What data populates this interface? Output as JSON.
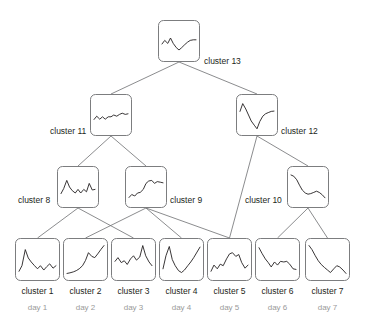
{
  "diagram": {
    "stroke_color": "#6d6e71",
    "line_color": "#231f20",
    "box_fill": "#ffffff",
    "label_color": "#231f20",
    "day_label_color": "#9a9a9a",
    "background": "#ffffff"
  },
  "chart_data": {
    "type": "line",
    "xlabel": "",
    "ylabel": "",
    "grid": false,
    "legend": "none",
    "ylim": [
      0,
      1
    ],
    "nodes": [
      {
        "id": "cluster1",
        "label": "cluster 1",
        "day": "day 1",
        "level": "leaf",
        "box": {
          "x": 15,
          "y": 238,
          "w": 45,
          "h": 43
        },
        "label_pos": {
          "x": 37.5,
          "y": 287
        },
        "day_pos": {
          "x": 37.5,
          "y": 304
        },
        "x": [
          0,
          0.08,
          0.17,
          0.25,
          0.33,
          0.42,
          0.5,
          0.58,
          0.67,
          0.75,
          0.83,
          0.92,
          1
        ],
        "values": [
          0.12,
          0.3,
          0.82,
          0.55,
          0.42,
          0.3,
          0.2,
          0.3,
          0.16,
          0.27,
          0.36,
          0.22,
          0.3
        ]
      },
      {
        "id": "cluster2",
        "label": "cluster 2",
        "day": "day 2",
        "level": "leaf",
        "box": {
          "x": 63,
          "y": 238,
          "w": 45,
          "h": 43
        },
        "label_pos": {
          "x": 85.5,
          "y": 287
        },
        "day_pos": {
          "x": 85.5,
          "y": 304
        },
        "x": [
          0,
          0.08,
          0.17,
          0.25,
          0.33,
          0.42,
          0.5,
          0.58,
          0.67,
          0.75,
          0.83,
          0.92,
          1
        ],
        "values": [
          0.05,
          0.07,
          0.1,
          0.14,
          0.2,
          0.3,
          0.47,
          0.72,
          0.6,
          0.56,
          0.68,
          0.83,
          0.95
        ]
      },
      {
        "id": "cluster3",
        "label": "cluster 3",
        "day": "day 3",
        "level": "leaf",
        "box": {
          "x": 111,
          "y": 238,
          "w": 45,
          "h": 43
        },
        "label_pos": {
          "x": 133.5,
          "y": 287
        },
        "day_pos": {
          "x": 133.5,
          "y": 304
        },
        "x": [
          0,
          0.08,
          0.17,
          0.25,
          0.33,
          0.42,
          0.5,
          0.58,
          0.67,
          0.75,
          0.83,
          0.92,
          1
        ],
        "values": [
          0.44,
          0.56,
          0.4,
          0.46,
          0.34,
          0.52,
          0.62,
          0.48,
          0.58,
          0.95,
          0.62,
          0.42,
          0.3
        ]
      },
      {
        "id": "cluster4",
        "label": "cluster 4",
        "day": "day 4",
        "level": "leaf",
        "box": {
          "x": 159,
          "y": 238,
          "w": 45,
          "h": 43
        },
        "label_pos": {
          "x": 181.5,
          "y": 287
        },
        "day_pos": {
          "x": 181.5,
          "y": 304
        },
        "x": [
          0,
          0.08,
          0.17,
          0.25,
          0.33,
          0.42,
          0.5,
          0.58,
          0.67,
          0.75,
          0.83,
          0.92,
          1
        ],
        "values": [
          0.2,
          0.62,
          0.92,
          0.5,
          0.3,
          0.14,
          0.08,
          0.16,
          0.3,
          0.42,
          0.56,
          0.74,
          0.9
        ]
      },
      {
        "id": "cluster5",
        "label": "cluster 5",
        "day": "day 5",
        "level": "leaf",
        "box": {
          "x": 207,
          "y": 238,
          "w": 45,
          "h": 43
        },
        "label_pos": {
          "x": 229.5,
          "y": 287
        },
        "day_pos": {
          "x": 229.5,
          "y": 304
        },
        "x": [
          0,
          0.08,
          0.17,
          0.25,
          0.33,
          0.42,
          0.5,
          0.58,
          0.67,
          0.75,
          0.83,
          0.92,
          1
        ],
        "values": [
          0.12,
          0.32,
          0.2,
          0.35,
          0.3,
          0.52,
          0.68,
          0.72,
          0.6,
          0.66,
          0.4,
          0.22,
          0.32
        ]
      },
      {
        "id": "cluster6",
        "label": "cluster 6",
        "day": "day 6",
        "level": "leaf",
        "box": {
          "x": 255,
          "y": 238,
          "w": 45,
          "h": 43
        },
        "label_pos": {
          "x": 277.5,
          "y": 287
        },
        "day_pos": {
          "x": 277.5,
          "y": 304
        },
        "x": [
          0,
          0.08,
          0.17,
          0.25,
          0.33,
          0.42,
          0.5,
          0.58,
          0.67,
          0.75,
          0.83,
          0.92,
          1
        ],
        "values": [
          0.88,
          0.7,
          0.52,
          0.4,
          0.26,
          0.42,
          0.32,
          0.44,
          0.42,
          0.44,
          0.35,
          0.2,
          0.18
        ]
      },
      {
        "id": "cluster7",
        "label": "cluster 7",
        "day": "day 7",
        "level": "leaf",
        "box": {
          "x": 305,
          "y": 238,
          "w": 45,
          "h": 43
        },
        "label_pos": {
          "x": 327.5,
          "y": 287
        },
        "day_pos": {
          "x": 327.5,
          "y": 304
        },
        "x": [
          0,
          0.08,
          0.17,
          0.25,
          0.33,
          0.42,
          0.5,
          0.58,
          0.67,
          0.75,
          0.83,
          0.92,
          1
        ],
        "values": [
          0.95,
          0.82,
          0.62,
          0.46,
          0.34,
          0.24,
          0.16,
          0.08,
          0.2,
          0.3,
          0.26,
          0.16,
          0.05
        ]
      },
      {
        "id": "cluster8",
        "label": "cluster 8",
        "level": "internal",
        "box": {
          "x": 57,
          "y": 166,
          "w": 42,
          "h": 42
        },
        "label_pos": {
          "x": 18,
          "y": 196
        },
        "x": [
          0,
          0.08,
          0.17,
          0.25,
          0.33,
          0.42,
          0.5,
          0.58,
          0.67,
          0.75,
          0.83,
          0.92,
          1
        ],
        "values": [
          0.28,
          0.45,
          0.72,
          0.5,
          0.38,
          0.3,
          0.42,
          0.3,
          0.42,
          0.34,
          0.62,
          0.4,
          0.42
        ]
      },
      {
        "id": "cluster9",
        "label": "cluster 9",
        "level": "internal",
        "box": {
          "x": 125,
          "y": 166,
          "w": 42,
          "h": 42
        },
        "label_pos": {
          "x": 170,
          "y": 196
        },
        "x": [
          0,
          0.08,
          0.17,
          0.25,
          0.33,
          0.42,
          0.5,
          0.58,
          0.67,
          0.75,
          0.83,
          0.92,
          1
        ],
        "values": [
          0.15,
          0.25,
          0.2,
          0.3,
          0.32,
          0.42,
          0.62,
          0.7,
          0.72,
          0.62,
          0.68,
          0.66,
          0.64
        ]
      },
      {
        "id": "cluster10",
        "label": "cluster 10",
        "level": "internal",
        "box": {
          "x": 287,
          "y": 166,
          "w": 42,
          "h": 42
        },
        "label_pos": {
          "x": 245,
          "y": 196
        },
        "x": [
          0,
          0.08,
          0.17,
          0.25,
          0.33,
          0.42,
          0.5,
          0.58,
          0.67,
          0.75,
          0.83,
          0.92,
          1
        ],
        "values": [
          0.9,
          0.86,
          0.74,
          0.56,
          0.4,
          0.3,
          0.26,
          0.28,
          0.32,
          0.36,
          0.32,
          0.24,
          0.14
        ]
      },
      {
        "id": "cluster11",
        "label": "cluster 11",
        "level": "internal",
        "box": {
          "x": 90,
          "y": 94,
          "w": 42,
          "h": 42
        },
        "label_pos": {
          "x": 50,
          "y": 127
        },
        "x": [
          0,
          0.08,
          0.17,
          0.25,
          0.33,
          0.42,
          0.5,
          0.58,
          0.67,
          0.75,
          0.83,
          0.92,
          1
        ],
        "values": [
          0.35,
          0.46,
          0.36,
          0.44,
          0.36,
          0.44,
          0.44,
          0.5,
          0.46,
          0.52,
          0.56,
          0.52,
          0.54
        ]
      },
      {
        "id": "cluster12",
        "label": "cluster 12",
        "level": "internal",
        "box": {
          "x": 236,
          "y": 94,
          "w": 42,
          "h": 42
        },
        "label_pos": {
          "x": 281,
          "y": 127
        },
        "x": [
          0,
          0.08,
          0.17,
          0.25,
          0.33,
          0.42,
          0.5,
          0.58,
          0.67,
          0.75,
          0.83,
          0.92,
          1
        ],
        "values": [
          0.62,
          0.88,
          0.7,
          0.5,
          0.3,
          0.16,
          0.04,
          0.28,
          0.46,
          0.54,
          0.58,
          0.62,
          0.63
        ]
      },
      {
        "id": "cluster13",
        "label": "cluster 13",
        "level": "root",
        "box": {
          "x": 158,
          "y": 20,
          "w": 42,
          "h": 42
        },
        "label_pos": {
          "x": 204,
          "y": 57
        },
        "x": [
          0,
          0.08,
          0.17,
          0.25,
          0.33,
          0.42,
          0.5,
          0.58,
          0.67,
          0.75,
          0.83,
          0.92,
          1
        ],
        "values": [
          0.4,
          0.52,
          0.42,
          0.6,
          0.42,
          0.28,
          0.2,
          0.28,
          0.38,
          0.46,
          0.52,
          0.54,
          0.54
        ]
      }
    ],
    "edges": [
      {
        "from": "cluster13",
        "to": "cluster11"
      },
      {
        "from": "cluster13",
        "to": "cluster12"
      },
      {
        "from": "cluster11",
        "to": "cluster8"
      },
      {
        "from": "cluster11",
        "to": "cluster9"
      },
      {
        "from": "cluster12",
        "to": "cluster5"
      },
      {
        "from": "cluster12",
        "to": "cluster10"
      },
      {
        "from": "cluster8",
        "to": "cluster1"
      },
      {
        "from": "cluster8",
        "to": "cluster3"
      },
      {
        "from": "cluster9",
        "to": "cluster2"
      },
      {
        "from": "cluster9",
        "to": "cluster4"
      },
      {
        "from": "cluster9",
        "to": "cluster5"
      },
      {
        "from": "cluster10",
        "to": "cluster6"
      },
      {
        "from": "cluster10",
        "to": "cluster7"
      }
    ]
  }
}
